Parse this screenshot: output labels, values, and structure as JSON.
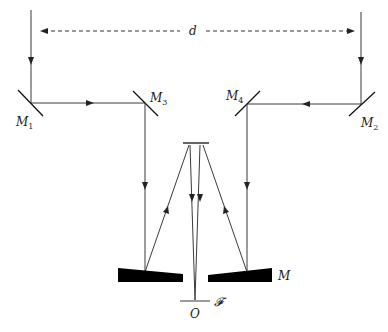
{
  "diagram": {
    "labels": {
      "baseline": "d",
      "mirror1": {
        "main": "M",
        "sub": "1"
      },
      "mirror2": {
        "main": "M",
        "sub": "2"
      },
      "mirror3": {
        "main": "M",
        "sub": "3"
      },
      "mirror4": {
        "main": "M",
        "sub": "4"
      },
      "primary_mirror": "M",
      "focal_plane": "𝓕",
      "origin": "O"
    },
    "colors": {
      "line": "#3a3a3a",
      "mirror_fill": "#000000",
      "background": "#ffffff"
    }
  }
}
